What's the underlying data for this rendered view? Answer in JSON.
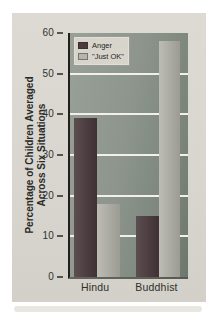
{
  "figure": {
    "panel_bg": "#d8d6cf",
    "plot_bg": "#8d958c",
    "gridline_color": "#f1f0ea",
    "axis_color": "#22201d",
    "text_color": "#2b2a27"
  },
  "chart_data": {
    "type": "bar",
    "title": "",
    "categories": [
      "Hindu",
      "Buddhist"
    ],
    "series": [
      {
        "name": "Anger",
        "values": [
          39,
          15
        ],
        "color": "#4a3a3c"
      },
      {
        "name": "\"Just OK\"",
        "values": [
          18,
          58
        ],
        "color": "#b5b5ac"
      }
    ],
    "xlabel": "",
    "ylabel": "Percentage of Children Averaged Across Six Situations",
    "ylabel_line1": "Percentage of Children Averaged",
    "ylabel_line2": "Across Six Situations",
    "ylim": [
      0,
      60
    ],
    "yticks": [
      0,
      10,
      20,
      30,
      40,
      50,
      60
    ],
    "grid": true,
    "gridline_values": [
      10,
      20,
      30,
      40,
      50
    ],
    "legend_position": "top-left"
  }
}
